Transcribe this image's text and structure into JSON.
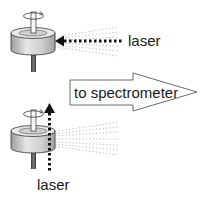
{
  "diagram": {
    "top_setup": {
      "laser_label": "laser",
      "laser_direction": "horizontal, from right toward sample"
    },
    "output_arrow": {
      "label": "to spectrometer"
    },
    "bottom_setup": {
      "laser_label": "laser",
      "laser_direction": "vertical, upward past sample"
    },
    "colors": {
      "outline": "#333333",
      "cylinder_body": "#d9d9d9",
      "cylinder_shade": "#a8a8a8",
      "shaft": "#555555",
      "laser_dots": "#111111",
      "scatter_dots": "#9a9a9a"
    },
    "icons": [
      "rotating-sample-holder",
      "laser-beam-arrow",
      "scatter-cone",
      "output-arrow"
    ]
  }
}
